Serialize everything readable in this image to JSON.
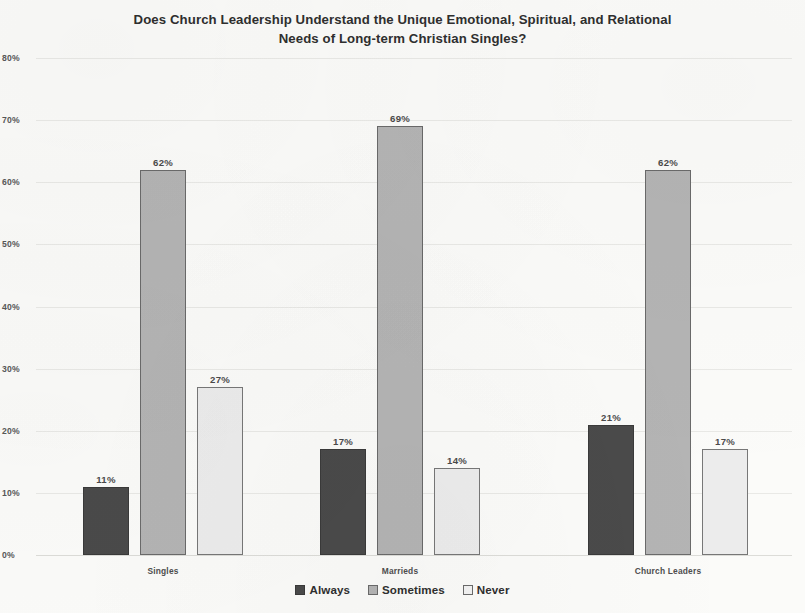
{
  "chart_data": {
    "type": "bar",
    "title": "Does Church Leadership Understand the Unique Emotional, Spiritual, and Relational Needs of Long-term Christian Singles?",
    "title_lines": [
      "Does Church Leadership Understand the Unique Emotional, Spiritual, and Relational",
      "Needs of Long-term Christian Singles?"
    ],
    "categories": [
      "Singles",
      "Marrieds",
      "Church Leaders"
    ],
    "series": [
      {
        "name": "Always",
        "values": [
          11,
          62,
          21
        ],
        "color": "#4a4a4a"
      },
      {
        "name": "Sometimes",
        "values": [
          62,
          69,
          62
        ],
        "color": "#b4b4b4"
      },
      {
        "name": "Never",
        "values": [
          27,
          14,
          17
        ],
        "color": "#ececec"
      }
    ],
    "value_labels": [
      [
        "11%",
        "62%",
        "27%"
      ],
      [
        "17%",
        "69%",
        "14%"
      ],
      [
        "21%",
        "62%",
        "17%"
      ]
    ],
    "xlabel": "",
    "ylabel": "",
    "ylim": [
      0,
      80
    ],
    "ytick_values": [
      0,
      10,
      20,
      30,
      40,
      50,
      60,
      70,
      80
    ],
    "ytick_labels": [
      "0%",
      "10%",
      "20%",
      "30%",
      "40%",
      "50%",
      "60%",
      "70%",
      "80%"
    ],
    "grid": true,
    "grid_axis": "y",
    "legend_position": "bottom",
    "value_labels_shown": true
  },
  "axis": {
    "ticks": [
      {
        "label": "80%",
        "value": 80
      },
      {
        "label": "70%",
        "value": 70
      },
      {
        "label": "60%",
        "value": 60
      },
      {
        "label": "50%",
        "value": 50
      },
      {
        "label": "40%",
        "value": 40
      },
      {
        "label": "30%",
        "value": 30
      },
      {
        "label": "20%",
        "value": 20
      },
      {
        "label": "10%",
        "value": 10
      },
      {
        "label": "0%",
        "value": 0
      }
    ]
  },
  "groups": [
    {
      "label": "Singles",
      "bars": [
        {
          "series": "Always",
          "value": 11,
          "label": "11%"
        },
        {
          "series": "Sometimes",
          "value": 62,
          "label": "62%"
        },
        {
          "series": "Never",
          "value": 27,
          "label": "27%"
        }
      ]
    },
    {
      "label": "Marrieds",
      "bars": [
        {
          "series": "Always",
          "value": 17,
          "label": "17%"
        },
        {
          "series": "Sometimes",
          "value": 69,
          "label": "69%"
        },
        {
          "series": "Never",
          "value": 14,
          "label": "14%"
        }
      ]
    },
    {
      "label": "Church Leaders",
      "bars": [
        {
          "series": "Always",
          "value": 21,
          "label": "21%"
        },
        {
          "series": "Sometimes",
          "value": 62,
          "label": "62%"
        },
        {
          "series": "Never",
          "value": 17,
          "label": "17%"
        }
      ]
    }
  ],
  "legend": {
    "items": [
      {
        "label": "Always",
        "color": "#4a4a4a"
      },
      {
        "label": "Sometimes",
        "color": "#b4b4b4"
      },
      {
        "label": "Never",
        "color": "#ececec"
      }
    ]
  }
}
